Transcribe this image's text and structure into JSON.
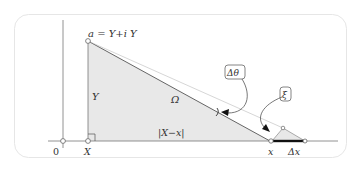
{
  "diagram": {
    "labels": {
      "apex": "a = Y+i Y",
      "height": "Y",
      "region": "Ω",
      "base": "|X−x|",
      "origin": "0",
      "foot": "X",
      "point_x": "x",
      "delta_x": "Δx",
      "delta_theta": "Δθ",
      "xi": "ξ"
    },
    "colors": {
      "fill": "#e8e8e8",
      "stroke": "#555555",
      "frame": "#e6e6e6",
      "axis": "#777777",
      "thick_segment": "#111111"
    }
  }
}
